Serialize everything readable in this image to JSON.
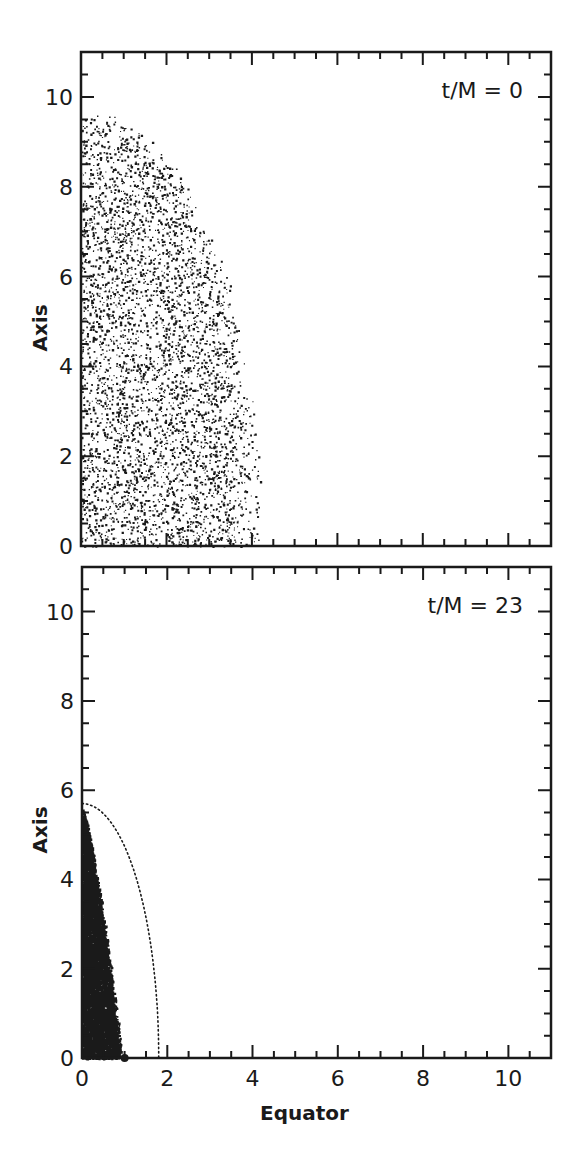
{
  "chart_data": [
    {
      "type": "scatter",
      "panel": "top",
      "annotation": "t/M = 0",
      "xlabel": "",
      "ylabel": "Axis",
      "xlim": [
        0,
        11
      ],
      "ylim": [
        0,
        11
      ],
      "x_ticks": [
        0,
        2,
        4,
        6,
        8,
        10
      ],
      "x_tick_labels": [],
      "y_ticks": [
        0,
        2,
        4,
        6,
        8,
        10
      ],
      "y_tick_labels": [
        "0",
        "2",
        "4",
        "6",
        "8",
        "10"
      ],
      "minor_tick_step": 0.5,
      "grid": false,
      "point_cloud": {
        "shape": "quarter-ellipse",
        "equator_extent": 4.2,
        "axis_extent": 9.6,
        "count": 4200,
        "dot_size": 1.6,
        "description": "uniform-ish random particle distribution filling a quarter ellipse"
      },
      "curves": [],
      "markers": []
    },
    {
      "type": "scatter",
      "panel": "bottom",
      "annotation": "t/M = 23",
      "xlabel": "Equator",
      "ylabel": "Axis",
      "xlim": [
        0,
        11
      ],
      "ylim": [
        0,
        11
      ],
      "x_ticks": [
        0,
        2,
        4,
        6,
        8,
        10
      ],
      "x_tick_labels": [
        "0",
        "2",
        "4",
        "6",
        "8",
        "10"
      ],
      "y_ticks": [
        0,
        2,
        4,
        6,
        8,
        10
      ],
      "y_tick_labels": [
        "0",
        "2",
        "4",
        "6",
        "8",
        "10"
      ],
      "minor_tick_step": 0.5,
      "grid": false,
      "point_cloud": {
        "shape": "triangle-like",
        "equator_extent": 0.9,
        "axis_extent": 5.6,
        "count": 9000,
        "dot_size": 1.8,
        "description": "dense collapsed particle cloud near the axis"
      },
      "curves": [
        {
          "name": "dotted-boundary",
          "style": "dotted",
          "shape": "quarter-ellipse",
          "equator_extent": 1.8,
          "axis_extent": 5.7
        }
      ],
      "markers": [
        {
          "name": "equator-dot",
          "x": 1.0,
          "y": 0.0,
          "radius": 4
        }
      ]
    }
  ],
  "figure": {
    "panels": [
      {
        "annotation": "t/M = 0",
        "ylabel": "Axis"
      },
      {
        "annotation": "t/M = 23",
        "ylabel": "Axis",
        "xlabel": "Equator"
      }
    ]
  }
}
